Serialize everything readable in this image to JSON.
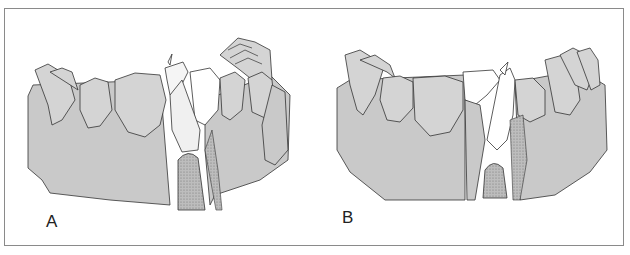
{
  "figure": {
    "panels": [
      {
        "label": "A",
        "description": "Lower arch illustration, instrument inserted at left-center position"
      },
      {
        "label": "B",
        "description": "Lower arch illustration, instrument inserted at center position"
      }
    ],
    "colors": {
      "gum_fill": "#c9c9c9",
      "tooth_fill": "#d4d4d4",
      "outline": "#333333",
      "border": "#8a8a8a"
    }
  }
}
